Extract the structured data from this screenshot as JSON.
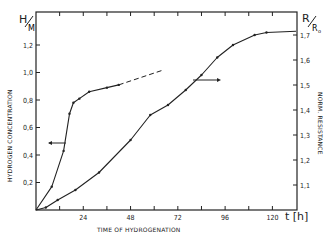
{
  "chart_data": {
    "type": "line",
    "title": "",
    "xlabel": "TIME OF HYDROGENATION",
    "xunit": "t [h]",
    "ylabel_left": "HYDROGEN CONCENTRATION",
    "ylabel_left_symbol": "H/M",
    "ylabel_right": "NORM. RESISTANCE",
    "ylabel_right_symbol": "R/R₀",
    "xlim": [
      0,
      132
    ],
    "ylim_left": [
      0,
      1.4
    ],
    "ylim_right": [
      1.0,
      1.72
    ],
    "x_ticks": [
      24,
      48,
      72,
      96,
      120
    ],
    "x_tick_labels": [
      "24",
      "48",
      "72",
      "96",
      "120"
    ],
    "y_left_ticks": [
      0.2,
      0.4,
      0.6,
      0.8,
      1.0,
      1.2
    ],
    "y_left_tick_labels": [
      "0,2",
      "0,4",
      "0,6",
      "0,8",
      "1,0",
      "1,2"
    ],
    "y_right_ticks": [
      1.1,
      1.2,
      1.3,
      1.4,
      1.5,
      1.6,
      1.7
    ],
    "y_right_tick_labels": [
      "1,1",
      "1,2",
      "1,3",
      "1,4",
      "1,5",
      "1,6",
      "1,7"
    ],
    "grid": false,
    "legend": "arrows indicate axis for each curve",
    "series": [
      {
        "name": "Hydrogen concentration H/M",
        "axis": "left",
        "x": [
          8,
          14,
          17,
          19,
          22,
          27,
          36,
          42
        ],
        "values": [
          0.17,
          0.43,
          0.7,
          0.78,
          0.81,
          0.86,
          0.89,
          0.91
        ],
        "extrapolation_dashed": {
          "x": [
            42,
            65
          ],
          "values": [
            0.91,
            1.02
          ]
        }
      },
      {
        "name": "Normalized resistance R/R0",
        "axis": "right",
        "x": [
          5,
          11,
          20,
          32,
          48,
          58,
          67,
          76,
          84,
          92,
          100,
          111,
          117
        ],
        "values": [
          1.01,
          1.04,
          1.08,
          1.15,
          1.28,
          1.38,
          1.42,
          1.48,
          1.54,
          1.61,
          1.66,
          1.7,
          1.71
        ]
      }
    ]
  }
}
